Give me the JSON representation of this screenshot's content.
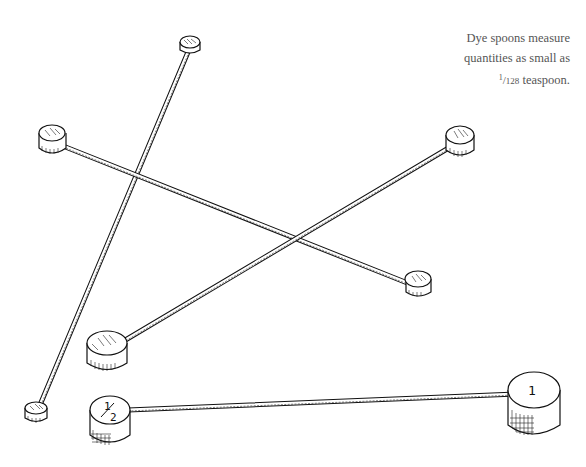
{
  "caption": {
    "line1": "Dye spoons measure",
    "line2": "quantities as small as",
    "fraction_numerator": "1",
    "fraction_separator": "/",
    "fraction_denominator": "128",
    "line3_suffix": " teaspoon."
  },
  "spoons": [
    {
      "id": "spoon-a",
      "label": "",
      "description": "small spoon, top center to bottom left"
    },
    {
      "id": "spoon-b",
      "label": "",
      "description": "spoon from upper left to lower right"
    },
    {
      "id": "spoon-c",
      "label": "",
      "description": "spoon from right to lower left"
    },
    {
      "id": "spoon-half",
      "label": "1/2",
      "label_num": "1",
      "label_den": "2"
    },
    {
      "id": "spoon-one",
      "label": "1"
    }
  ],
  "colors": {
    "ink": "#111111",
    "caption_text": "#555555",
    "background": "#ffffff"
  }
}
